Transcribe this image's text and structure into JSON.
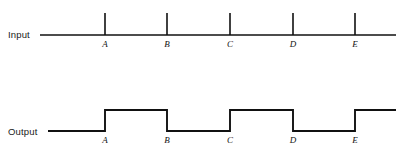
{
  "figure": {
    "type": "timing-diagram",
    "background_color": "#ffffff",
    "line_color": "#111111",
    "width": 401,
    "height": 151
  },
  "rows": {
    "input": {
      "label": "Input",
      "baseline_y": 35,
      "line_start_x": 40,
      "line_end_x": 396,
      "tick_top_y": 13
    },
    "output": {
      "label": "Output",
      "low_y": 131,
      "high_y": 110,
      "line_start_x": 48,
      "line_end_x": 396
    }
  },
  "events": [
    {
      "name": "A",
      "x": 105
    },
    {
      "name": "B",
      "x": 167
    },
    {
      "name": "C",
      "x": 230
    },
    {
      "name": "D",
      "x": 293
    },
    {
      "name": "E",
      "x": 355
    }
  ],
  "chart_data": {
    "type": "line",
    "title": "",
    "xlabel": "",
    "ylabel": "",
    "categories": [
      "A",
      "B",
      "C",
      "D",
      "E"
    ],
    "series": [
      {
        "name": "Input",
        "kind": "impulse-ticks",
        "values": [
          1,
          1,
          1,
          1,
          1
        ],
        "description": "Narrow vertical pulses (ticks) rising above a flat horizontal baseline at each of the five marked instants A, B, C, D and E."
      },
      {
        "name": "Output",
        "kind": "square-wave",
        "values": [
          1,
          0,
          1,
          0,
          1
        ],
        "description": "A toggling square wave: low before A, goes high at A, low at B, high at C, low at D, high at E and remains high to the right edge.",
        "transitions": [
          {
            "at": "A",
            "to": "high"
          },
          {
            "at": "B",
            "to": "low"
          },
          {
            "at": "C",
            "to": "high"
          },
          {
            "at": "D",
            "to": "low"
          },
          {
            "at": "E",
            "to": "high"
          }
        ]
      }
    ],
    "grid": false,
    "legend": "none"
  }
}
